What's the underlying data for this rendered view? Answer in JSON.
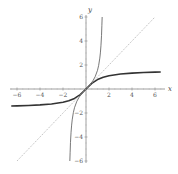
{
  "chart_data": {
    "type": "line",
    "title": "",
    "xlabel": "x",
    "ylabel": "y",
    "xlim": [
      -6.5,
      6.5
    ],
    "ylim": [
      -6,
      6
    ],
    "grid": false,
    "legend": null,
    "x_ticks": [
      -6,
      -4,
      -2,
      2,
      4,
      6
    ],
    "y_ticks": [
      -6,
      -4,
      -2,
      2,
      4,
      6
    ],
    "series": [
      {
        "name": "arctan(x)",
        "style": "solid-thick",
        "color": "#333333",
        "x": [
          -6.5,
          -6,
          -5,
          -4,
          -3,
          -2,
          -1.5,
          -1,
          -0.5,
          0,
          0.5,
          1,
          1.5,
          2,
          3,
          4,
          5,
          6,
          6.5
        ],
        "y": [
          -1.418,
          -1.406,
          -1.373,
          -1.326,
          -1.249,
          -1.107,
          -0.983,
          -0.785,
          -0.464,
          0,
          0.464,
          0.785,
          0.983,
          1.107,
          1.249,
          1.326,
          1.373,
          1.406,
          1.418
        ]
      },
      {
        "name": "tan(x)",
        "style": "solid-thin",
        "color": "#555555",
        "x": [
          -1.406,
          -1.38,
          -1.35,
          -1.3,
          -1.25,
          -1.2,
          -1.1,
          -1.0,
          -0.8,
          -0.6,
          -0.4,
          -0.2,
          0,
          0.2,
          0.4,
          0.6,
          0.8,
          1.0,
          1.1,
          1.2,
          1.25,
          1.3,
          1.35,
          1.38,
          1.406
        ],
        "y": [
          -6.0,
          -5.28,
          -4.455,
          -3.602,
          -3.01,
          -2.572,
          -1.965,
          -1.557,
          -1.03,
          -0.684,
          -0.423,
          -0.203,
          0,
          0.203,
          0.423,
          0.684,
          1.03,
          1.557,
          1.965,
          2.572,
          3.01,
          3.602,
          4.455,
          5.28,
          6.0
        ]
      },
      {
        "name": "y = x",
        "style": "dotted",
        "color": "#aaaaaa",
        "x": [
          -6,
          6
        ],
        "y": [
          -6,
          6
        ]
      }
    ]
  }
}
